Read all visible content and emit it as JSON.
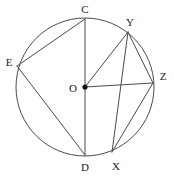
{
  "figure": {
    "type": "circle-geometry-diagram",
    "background_color": "#ffffff",
    "stroke_color": "#4a4a4a",
    "label_color": "#1a1a1a",
    "stroke_width": 1
  },
  "circle": {
    "name": "main-circle",
    "center_x": 85,
    "center_y": 87,
    "radius": 69
  },
  "center_point": {
    "label": "O",
    "x": 85,
    "y": 87,
    "label_x": 73,
    "label_y": 88,
    "dot_radius": 2.6,
    "filled": true
  },
  "points": [
    {
      "label": "C",
      "x": 85,
      "y": 19,
      "label_x": 85,
      "label_y": 9
    },
    {
      "label": "Y",
      "x": 128,
      "y": 32,
      "label_x": 130,
      "label_y": 22
    },
    {
      "label": "E",
      "x": 17,
      "y": 66,
      "label_x": 9,
      "label_y": 62
    },
    {
      "label": "Z",
      "x": 153,
      "y": 83,
      "label_x": 163,
      "label_y": 76
    },
    {
      "label": "D",
      "x": 85,
      "y": 155,
      "label_x": 85,
      "label_y": 167
    },
    {
      "label": "X",
      "x": 112,
      "y": 152,
      "label_x": 116,
      "label_y": 166
    }
  ],
  "segments": [
    {
      "name": "chord-C-D",
      "from": "C",
      "to": "D",
      "x1": 85,
      "y1": 19,
      "x2": 85,
      "y2": 155
    },
    {
      "name": "chord-E-C",
      "from": "E",
      "to": "C",
      "x1": 17,
      "y1": 66,
      "x2": 85,
      "y2": 19
    },
    {
      "name": "chord-E-D",
      "from": "E",
      "to": "D",
      "x1": 17,
      "y1": 66,
      "x2": 85,
      "y2": 155
    },
    {
      "name": "radius-O-Y",
      "from": "O",
      "to": "Y",
      "x1": 85,
      "y1": 87,
      "x2": 128,
      "y2": 32
    },
    {
      "name": "radius-O-Z",
      "from": "O",
      "to": "Z",
      "x1": 85,
      "y1": 87,
      "x2": 153,
      "y2": 83
    },
    {
      "name": "chord-Y-X",
      "from": "Y",
      "to": "X",
      "x1": 128,
      "y1": 32,
      "x2": 112,
      "y2": 152
    },
    {
      "name": "chord-Y-Z",
      "from": "Y",
      "to": "Z",
      "x1": 128,
      "y1": 32,
      "x2": 153,
      "y2": 83
    },
    {
      "name": "chord-Z-X",
      "from": "Z",
      "to": "X",
      "x1": 153,
      "y1": 83,
      "x2": 112,
      "y2": 152
    }
  ]
}
